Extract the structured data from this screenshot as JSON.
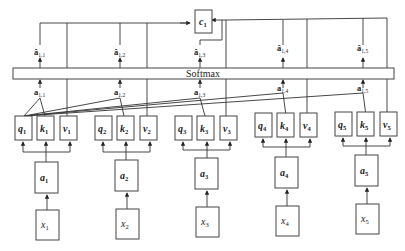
{
  "diagram": {
    "softmax_label": "Softmax",
    "output": {
      "label": "c",
      "sub": "1"
    },
    "columns": [
      {
        "x_label": "x",
        "x_sub": "1",
        "a_label": "a",
        "a_sub": "1",
        "q": "q",
        "k": "k",
        "v": "v",
        "idx": "1",
        "score": "a",
        "score_sub": "1,1",
        "norm": "â",
        "norm_sub": "1,1"
      },
      {
        "x_label": "x",
        "x_sub": "2",
        "a_label": "a",
        "a_sub": "2",
        "q": "q",
        "k": "k",
        "v": "v",
        "idx": "2",
        "score": "a",
        "score_sub": "1,2",
        "norm": "â",
        "norm_sub": "1,2"
      },
      {
        "x_label": "x",
        "x_sub": "3",
        "a_label": "a",
        "a_sub": "3",
        "q": "q",
        "k": "k",
        "v": "v",
        "idx": "3",
        "score": "a",
        "score_sub": "1,3",
        "norm": "â",
        "norm_sub": "1,3"
      },
      {
        "x_label": "x",
        "x_sub": "4",
        "a_label": "a",
        "a_sub": "4",
        "q": "q",
        "k": "k",
        "v": "v",
        "idx": "4",
        "score": "a",
        "score_sub": "1,4",
        "norm": "â",
        "norm_sub": "1,4"
      },
      {
        "x_label": "x",
        "x_sub": "5",
        "a_label": "a",
        "a_sub": "5",
        "q": "q",
        "k": "k",
        "v": "v",
        "idx": "5",
        "score": "a",
        "score_sub": "1,5",
        "norm": "â",
        "norm_sub": "1,5"
      }
    ]
  }
}
